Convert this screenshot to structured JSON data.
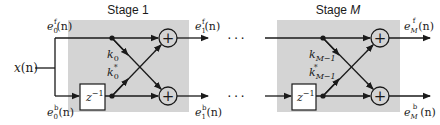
{
  "diagram": {
    "colors": {
      "stage_fill": "#d4d4d4",
      "line": "#1a1a1a",
      "delay_fill": "#ffffff"
    },
    "input": {
      "symbol": "x",
      "arg": "(n)"
    },
    "stages": [
      {
        "title_prefix": "Stage ",
        "title_index": "1",
        "title_index_italic": false,
        "forward_in": {
          "base": "e",
          "sup": "f",
          "sub": "0",
          "arg": "(n)"
        },
        "backward_in": {
          "base": "e",
          "sup": "b",
          "sub": "0",
          "arg": "(n)"
        },
        "forward_out": {
          "base": "e",
          "sup": "f",
          "sub": "1",
          "arg": "(n)"
        },
        "backward_out": {
          "base": "e",
          "sup": "b",
          "sub": "1",
          "arg": "(n)"
        },
        "coef": {
          "base": "k",
          "sub": "0"
        },
        "coef_conj": {
          "base": "k",
          "sub": "0",
          "sup": "*"
        },
        "delay": {
          "base": "z",
          "sup": "−1"
        },
        "adder_symbol": "+"
      },
      {
        "title_prefix": "Stage ",
        "title_index": "M",
        "title_index_italic": true,
        "forward_out": {
          "base": "e",
          "sup": "f",
          "sub": "M",
          "arg": "(n)"
        },
        "backward_out": {
          "base": "e",
          "sup": "b",
          "sub": "M",
          "arg": "(n)"
        },
        "coef": {
          "base": "k",
          "sub": "M−1"
        },
        "coef_conj": {
          "base": "k",
          "sub": "M−1",
          "sup": "*"
        },
        "delay": {
          "base": "z",
          "sup": "−1"
        },
        "adder_symbol": "+"
      }
    ],
    "ellipsis": "···"
  }
}
